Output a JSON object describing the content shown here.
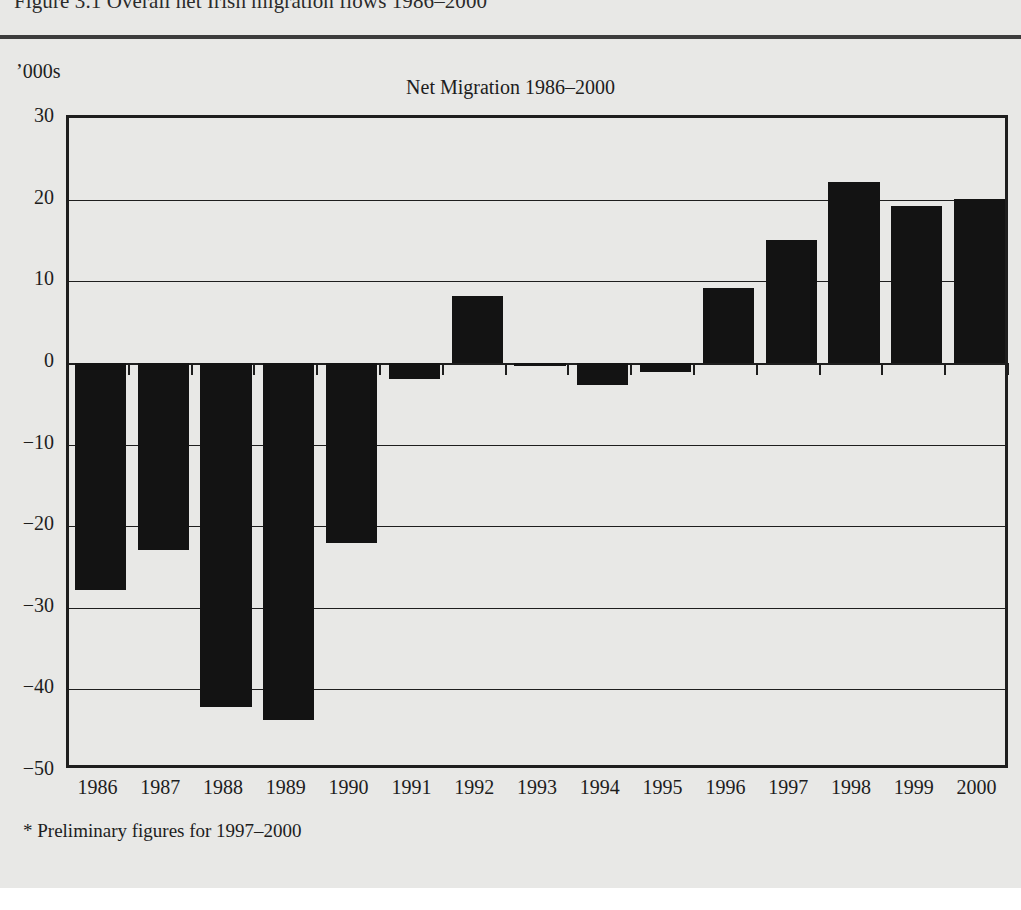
{
  "figure": {
    "caption": "Figure 3.1 Overall net Irish migration flows 1986–2000",
    "unit_label": "’000s",
    "footnote": "* Preliminary figures for 1997–2000"
  },
  "chart_data": {
    "type": "bar",
    "title": "Net Migration 1986–2000",
    "xlabel": "",
    "ylabel": "’000s",
    "ylim": [
      -50,
      30
    ],
    "yticks": [
      30,
      20,
      10,
      0,
      -10,
      -20,
      -30,
      -40,
      -50
    ],
    "ytick_labels": [
      "30",
      "20",
      "10",
      "0",
      "−10",
      "−20",
      "−30",
      "−40",
      "−50"
    ],
    "grid": true,
    "legend": "none",
    "bar_color": "#131313",
    "categories": [
      "1986",
      "1987",
      "1988",
      "1989",
      "1990",
      "1991",
      "1992",
      "1993",
      "1994",
      "1995",
      "1996",
      "1997",
      "1998",
      "1999",
      "2000"
    ],
    "values": [
      -27.8,
      -22.9,
      -42.1,
      -43.8,
      -22.1,
      -2.0,
      8.2,
      -0.4,
      -2.7,
      -1.1,
      9.2,
      15.1,
      22.1,
      19.2,
      20.1
    ]
  }
}
